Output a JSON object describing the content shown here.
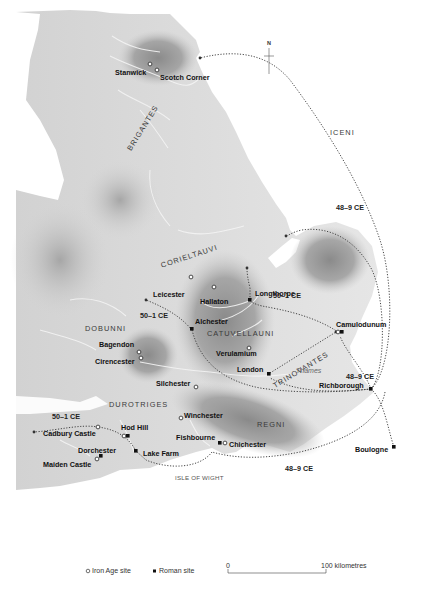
{
  "map": {
    "north_arrow": {
      "label": "N"
    },
    "tribes": [
      {
        "name": "BRIGANTES",
        "x": 138,
        "y": 138,
        "rotate": -58
      },
      {
        "name": "CORIELTAUVI",
        "x": 157,
        "y": 250,
        "rotate": -20
      },
      {
        "name": "ICENI",
        "x": 331,
        "y": 129,
        "rotate": 0
      },
      {
        "name": "DOBUNNI",
        "x": 84,
        "y": 324,
        "rotate": 0
      },
      {
        "name": "CATUVELLAUNI",
        "x": 206,
        "y": 329,
        "rotate": 0
      },
      {
        "name": "TRINOVANTES",
        "x": 268,
        "y": 362,
        "rotate": -30
      },
      {
        "name": "DUROTRIGES",
        "x": 109,
        "y": 400,
        "rotate": 0
      },
      {
        "name": "REGNI",
        "x": 256,
        "y": 421,
        "rotate": 0
      }
    ],
    "iron_age_sites": [
      {
        "name": "Stanwick",
        "x": 150,
        "y": 64
      },
      {
        "name": "Scotch Corner",
        "x": 157,
        "y": 70
      },
      {
        "name": "Leicester",
        "x": 191,
        "y": 277
      },
      {
        "name": "Hallaton",
        "x": 214,
        "y": 287
      },
      {
        "name": "Bagendon",
        "x": 139,
        "y": 352
      },
      {
        "name": "Cirencester",
        "x": 141,
        "y": 358
      },
      {
        "name": "Verulamium",
        "x": 249,
        "y": 348
      },
      {
        "name": "Silchester",
        "x": 196,
        "y": 387
      },
      {
        "name": "Winchester",
        "x": 181,
        "y": 418
      },
      {
        "name": "Chichester",
        "x": 225,
        "y": 443
      },
      {
        "name": "Cadbury Castle",
        "x": 98,
        "y": 427
      },
      {
        "name": "Hod Hill",
        "x": 124,
        "y": 436
      },
      {
        "name": "Maiden Castle",
        "x": 97,
        "y": 459
      },
      {
        "name": "Camulodunum",
        "x": 338,
        "y": 332
      }
    ],
    "roman_sites": [
      {
        "name": "Longthorpe",
        "x": 250,
        "y": 300
      },
      {
        "name": "Alchester",
        "x": 192,
        "y": 329
      },
      {
        "name": "London",
        "x": 269,
        "y": 374
      },
      {
        "name": "Camulodunum",
        "x": 342,
        "y": 332
      },
      {
        "name": "Richborough",
        "x": 371,
        "y": 389
      },
      {
        "name": "Boulogne",
        "x": 394,
        "y": 447
      },
      {
        "name": "Fishbourne",
        "x": 220,
        "y": 443
      },
      {
        "name": "Hod Hill",
        "x": 128,
        "y": 436
      },
      {
        "name": "Lake Farm",
        "x": 136,
        "y": 451
      },
      {
        "name": "Dorchester",
        "x": 101,
        "y": 456
      }
    ],
    "place_labels": {
      "stanwick": "Stanwick",
      "scotch_corner": "Scotch Corner",
      "leicester": "Leicester",
      "hallaton": "Hallaton",
      "longthorpe": "Longthorpe",
      "alchester": "Alchester",
      "bagendon": "Bagendon",
      "cirencester": "Cirencester",
      "verulamium": "Verulamium",
      "camulodunum": "Camulodunum",
      "london": "London",
      "richborough": "Richborough",
      "silchester": "Silchester",
      "winchester": "Winchester",
      "fishbourne": "Fishbourne",
      "chichester": "Chichester",
      "cadbury_castle": "Cadbury Castle",
      "hod_hill": "Hod Hill",
      "lake_farm": "Lake Farm",
      "dorchester": "Dorchester",
      "maiden_castle": "Maiden Castle",
      "boulogne": "Boulogne"
    },
    "tribe_labels": {
      "brigantes": "BRIGANTES",
      "corieltauvi": "CORIELTAUVI",
      "iceni": "ICENI",
      "dobunni": "DOBUNNI",
      "catuvellauni": "CATUVELLAUNI",
      "trinovantes": "TRINOVANTES",
      "durotriges": "DUROTRIGES",
      "regni": "REGNI"
    },
    "route_dates": {
      "north_east": "48–9 CE",
      "longthorpe": "50–1 CE",
      "alchester": "50–1 CE",
      "richborough": "48–9 CE",
      "south_coast": "48–9 CE",
      "south_west": "50–1 CE"
    },
    "other_labels": {
      "thames": "Thames",
      "isle_of_wight": "ISLE OF WIGHT"
    }
  },
  "legend": {
    "iron_age_site": "Iron Age site",
    "roman_site": "Roman site"
  },
  "scale": {
    "start": "0",
    "end": "100 kilometres"
  }
}
